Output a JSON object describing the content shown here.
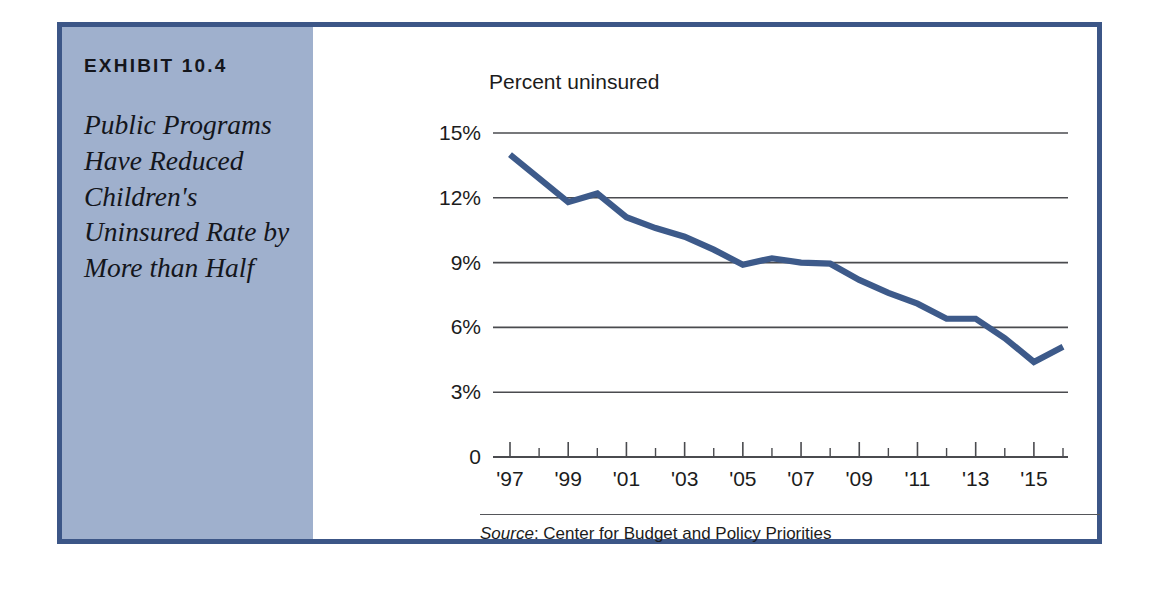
{
  "exhibit": {
    "label": "EXHIBIT 10.4",
    "title": "Public Programs Have Reduced Children's Uninsured Rate by More than Half"
  },
  "chart_data": {
    "type": "line",
    "title": "Percent uninsured",
    "xlabel": "",
    "ylabel": "Percent uninsured",
    "ylim": [
      0,
      15
    ],
    "yticks": [
      0,
      3,
      6,
      9,
      12,
      15
    ],
    "ytick_labels": [
      "0",
      "3%",
      "6%",
      "9%",
      "12%",
      "15%"
    ],
    "grid": true,
    "legend": "none",
    "x": [
      "1997",
      "1998",
      "1999",
      "2000",
      "2001",
      "2002",
      "2003",
      "2004",
      "2005",
      "2006",
      "2007",
      "2008",
      "2009",
      "2010",
      "2011",
      "2012",
      "2013",
      "2014",
      "2015",
      "2016"
    ],
    "xtick_labels": [
      "'97",
      "'99",
      "'01",
      "'03",
      "'05",
      "'07",
      "'09",
      "'11",
      "'13",
      "'15"
    ],
    "xtick_label_years": [
      "1997",
      "1999",
      "2001",
      "2003",
      "2005",
      "2007",
      "2009",
      "2011",
      "2013",
      "2015"
    ],
    "series": [
      {
        "name": "Percent of children uninsured",
        "color": "#3d5a8a",
        "values": [
          14.0,
          12.9,
          11.8,
          12.2,
          11.1,
          10.6,
          10.2,
          9.6,
          8.9,
          9.2,
          9.0,
          8.95,
          8.2,
          7.6,
          7.1,
          6.4,
          6.4,
          5.5,
          4.4,
          5.1
        ]
      }
    ],
    "source_prefix": "Source",
    "source_text": ": Center for Budget and Policy Priorities"
  },
  "colors": {
    "frame_border": "#3c5687",
    "caption_panel": "#9fb0cd",
    "series_line": "#3d5a8a",
    "grid": "#4a4b4f",
    "text": "#1c1c1c"
  }
}
